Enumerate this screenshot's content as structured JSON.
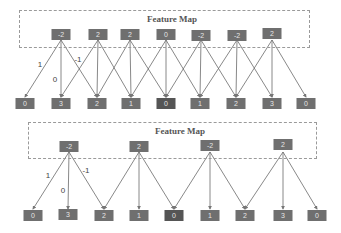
{
  "colors": {
    "node": "#6f6f6f",
    "node_dark": "#555555",
    "arrow": "#666666",
    "dashed_border": "#9a9a9a"
  },
  "diagrams": [
    {
      "name": "stride-1",
      "title": "Feature Map",
      "feature_map": [
        "-2",
        "2",
        "2",
        "0",
        "-2",
        "-2",
        "2"
      ],
      "output": [
        "0",
        "3",
        "2",
        "1",
        "0",
        "1",
        "2",
        "3",
        "0"
      ],
      "weights": [
        "1",
        "0",
        "-1"
      ],
      "stride": 1
    },
    {
      "name": "stride-2",
      "title": "Feature Map",
      "feature_map": [
        "-2",
        "2",
        "-2",
        "2"
      ],
      "output": [
        "0",
        "3",
        "2",
        "1",
        "0",
        "1",
        "2",
        "3",
        "0"
      ],
      "weights": [
        "1",
        "0",
        "-1"
      ],
      "stride": 2
    }
  ]
}
